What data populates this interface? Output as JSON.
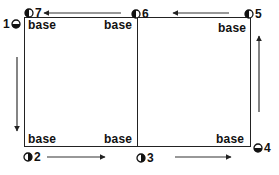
{
  "diagram": {
    "cell_label": "base",
    "bases": [
      {
        "position": "top-left",
        "label": "base"
      },
      {
        "position": "top-middle",
        "label": "base"
      },
      {
        "position": "top-right",
        "label": "base"
      },
      {
        "position": "bottom-left",
        "label": "base"
      },
      {
        "position": "bottom-middle",
        "label": "base"
      },
      {
        "position": "bottom-right",
        "label": "base"
      }
    ],
    "markers": [
      {
        "number": "1",
        "icon": "half-circle-bottom-filled",
        "position": "left-top"
      },
      {
        "number": "2",
        "icon": "half-circle-right-filled",
        "position": "bottom-left"
      },
      {
        "number": "3",
        "icon": "half-circle-right-filled",
        "position": "bottom-middle"
      },
      {
        "number": "4",
        "icon": "half-circle-bottom-filled",
        "position": "bottom-right"
      },
      {
        "number": "5",
        "icon": "half-circle-left-filled",
        "position": "top-right"
      },
      {
        "number": "6",
        "icon": "half-circle-left-filled",
        "position": "top-middle"
      },
      {
        "number": "7",
        "icon": "half-circle-left-filled",
        "position": "top-left"
      }
    ],
    "arrows": [
      {
        "from": "1",
        "to": "2",
        "direction": "down"
      },
      {
        "from": "2",
        "to": "3",
        "direction": "right"
      },
      {
        "from": "3",
        "to": "4",
        "direction": "right"
      },
      {
        "from": "4",
        "to": "5",
        "direction": "up"
      },
      {
        "from": "5",
        "to": "6",
        "direction": "left"
      },
      {
        "from": "6",
        "to": "7",
        "direction": "left"
      }
    ],
    "colors": {
      "line": "#222222",
      "text": "#111111",
      "background": "#ffffff"
    }
  }
}
